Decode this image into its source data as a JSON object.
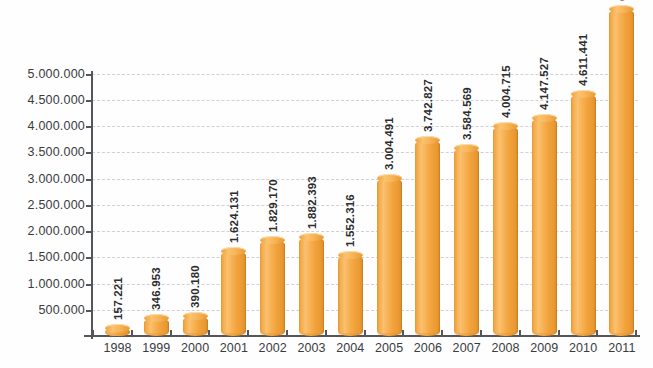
{
  "chart_data": {
    "type": "bar",
    "title": "",
    "subtitle": "",
    "xlabel": "",
    "ylabel": "",
    "categories": [
      "1998",
      "1999",
      "2000",
      "2001",
      "2002",
      "2003",
      "2004",
      "2005",
      "2006",
      "2007",
      "2008",
      "2009",
      "2010",
      "2011"
    ],
    "values": [
      157221,
      346953,
      390180,
      1624131,
      1829170,
      1882393,
      1552316,
      3004491,
      3742827,
      3584569,
      4004715,
      4147527,
      4611441,
      6221697
    ],
    "value_labels": [
      "157.221",
      "346.953",
      "390.180",
      "1.624.131",
      "1.829.170",
      "1.882.393",
      "1.552.316",
      "3.004.491",
      "3.742.827",
      "3.584.569",
      "4.004.715",
      "4.147.527",
      "4.611.441",
      "6.221.697"
    ],
    "ylim": [
      0,
      5500000
    ],
    "ytick_values": [
      500000,
      1000000,
      1500000,
      2000000,
      2500000,
      3000000,
      3500000,
      4000000,
      4500000,
      5000000
    ],
    "ytick_labels": [
      "500.000",
      "1.000.000",
      "1.500.000",
      "2.000.000",
      "2.500.000",
      "3.000.000",
      "3.500.000",
      "4.000.000",
      "4.500.000",
      "5.000.000"
    ],
    "grid": true,
    "grid_style": "dashed",
    "grid_color": "#c9cace",
    "legend": false,
    "legend_position": "none",
    "bar_color": "#f2a23a",
    "bar_highlight_color": "#fbc070",
    "bar_shadow_color": "#d98c28",
    "axis_color": "#55565a",
    "label_color": "#3b3c3e",
    "value_label_color": "#2b2c2e",
    "value_label_rotation": -90,
    "background_color": "#ffffff",
    "number_format": "european-dot-thousands"
  }
}
